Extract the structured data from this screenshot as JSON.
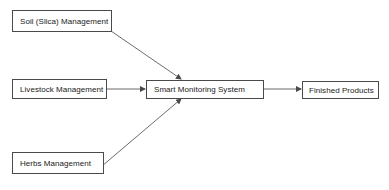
{
  "diagram": {
    "type": "flowchart",
    "nodes": {
      "soil": {
        "label": "Soil (Slica) Management"
      },
      "livestock": {
        "label": "Livestock Management"
      },
      "herbs": {
        "label": "Herbs Management"
      },
      "smart": {
        "label": "Smart Monitoring System"
      },
      "finished": {
        "label": "Finished Products"
      }
    },
    "edges": [
      {
        "from": "Soil (Slica) Management",
        "to": "Smart Monitoring System"
      },
      {
        "from": "Livestock Management",
        "to": "Smart Monitoring System"
      },
      {
        "from": "Herbs Management",
        "to": "Smart Monitoring System"
      },
      {
        "from": "Smart Monitoring System",
        "to": "Finished Products"
      }
    ],
    "colors": {
      "border": "#4a4a4a",
      "arrow": "#5a5a5a",
      "background": "#ffffff",
      "text": "#1a1a1a"
    }
  }
}
